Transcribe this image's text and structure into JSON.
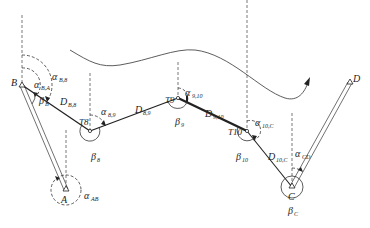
{
  "diagram": {
    "type": "traverse-survey-diagram",
    "points": {
      "A": {
        "label": "A",
        "x": 66,
        "y": 190
      },
      "B": {
        "label": "B",
        "x": 22,
        "y": 85
      },
      "T8": {
        "label": "T8",
        "x": 90,
        "y": 131
      },
      "T9": {
        "label": "T9",
        "x": 178,
        "y": 98
      },
      "T10": {
        "label": "T10",
        "x": 247,
        "y": 131
      },
      "C": {
        "label": "C",
        "x": 292,
        "y": 187
      },
      "D": {
        "label": "D",
        "x": 350,
        "y": 82
      }
    },
    "azimuths": {
      "a_BA": {
        "sym": "α",
        "sub": "B,A"
      },
      "a_B8": {
        "sym": "α",
        "sub": "B,8"
      },
      "a_89": {
        "sym": "α",
        "sub": "8,9"
      },
      "a_910": {
        "sym": "α",
        "sub": "9,10"
      },
      "a_10C": {
        "sym": "α",
        "sub": "10,C"
      },
      "a_CD": {
        "sym": "α",
        "sub": "CD"
      },
      "a_AB": {
        "sym": "α",
        "sub": "AB"
      }
    },
    "angles": {
      "b_B": {
        "sym": "β",
        "sub": "B"
      },
      "b_8": {
        "sym": "β",
        "sub": "8"
      },
      "b_9": {
        "sym": "β",
        "sub": "9"
      },
      "b_10": {
        "sym": "β",
        "sub": "10"
      },
      "b_C": {
        "sym": "β",
        "sub": "C"
      }
    },
    "distances": {
      "D_B8": {
        "sym": "D",
        "sub": "B,8"
      },
      "D_89": {
        "sym": "D",
        "sub": "8,9"
      },
      "D_910": {
        "sym": "D",
        "sub": "9,10"
      },
      "D_10C": {
        "sym": "D",
        "sub": "10,C"
      }
    },
    "colors": {
      "line": "#222222",
      "dashed": "#555555",
      "background": "#ffffff"
    }
  }
}
